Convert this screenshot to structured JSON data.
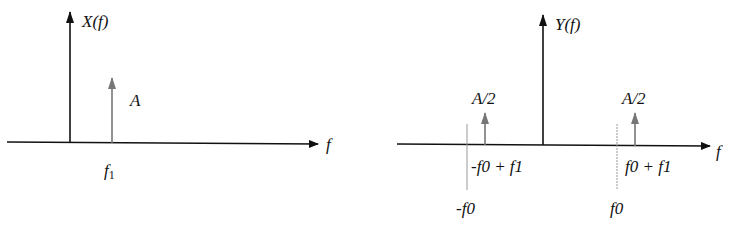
{
  "left_plot": {
    "y_label": "X(f)",
    "x_label": "f",
    "impulse": {
      "label": "A",
      "position_label": "f1",
      "position_main": "f",
      "position_sub": "1"
    }
  },
  "right_plot": {
    "y_label": "Y(f)",
    "x_label": "f",
    "impulses": [
      {
        "label": "A/2",
        "position_label": "-f0 + f1"
      },
      {
        "label": "A/2",
        "position_label": "f0 + f1"
      }
    ],
    "ticks": [
      {
        "label": "-f0"
      },
      {
        "label": "f0"
      }
    ]
  },
  "colors": {
    "axis": "#111111",
    "impulse": "#777777",
    "tick": "#999999"
  }
}
